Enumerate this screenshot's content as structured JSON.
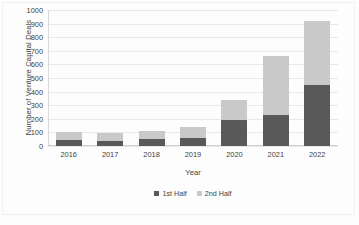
{
  "chart_data": {
    "type": "bar",
    "subtype": "stacked-column",
    "title": "",
    "xlabel": "Year",
    "ylabel": "Number of Venture  Capital Deals",
    "categories": [
      "2016",
      "2017",
      "2018",
      "2019",
      "2020",
      "2021",
      "2022"
    ],
    "series": [
      {
        "name": "1st Half",
        "color": "#595959",
        "values": [
          45,
          40,
          55,
          60,
          190,
          230,
          450
        ]
      },
      {
        "name": "2nd Half",
        "color": "#c9c9c9",
        "values": [
          55,
          55,
          55,
          80,
          150,
          430,
          470
        ]
      }
    ],
    "totals": [
      100,
      95,
      110,
      140,
      340,
      660,
      920
    ],
    "ylim": [
      0,
      1000
    ],
    "yticks": [
      "0",
      "100",
      "200",
      "300",
      "400",
      "500",
      "600",
      "700",
      "800",
      "900",
      "1000"
    ],
    "ytick_values": [
      0,
      100,
      200,
      300,
      400,
      500,
      600,
      700,
      800,
      900,
      1000
    ],
    "grid": true,
    "legend_position": "bottom"
  },
  "legend": {
    "items": [
      {
        "label": "1st Half",
        "color": "#595959"
      },
      {
        "label": "2nd Half",
        "color": "#c9c9c9"
      }
    ]
  }
}
